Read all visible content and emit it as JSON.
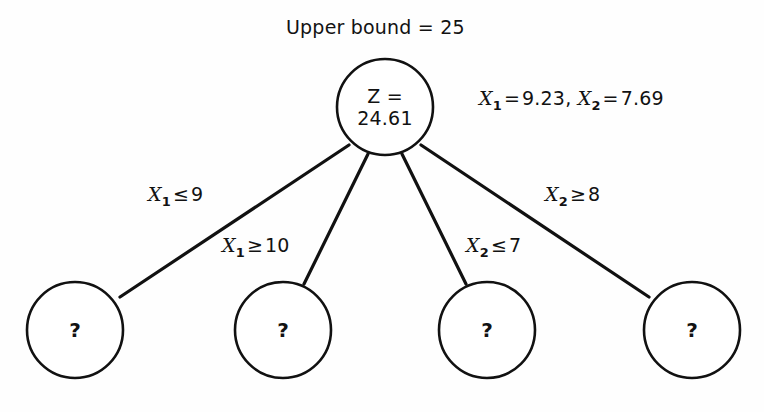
{
  "diagram": {
    "title": "Upper bound = 25",
    "root": {
      "line1": "Z =",
      "line2": "24.61"
    },
    "solution": {
      "var1": "X",
      "sub1": "1",
      "eq1": "=",
      "val1": "9.23,",
      "var2": "X",
      "sub2": "2",
      "eq2": "=",
      "val2": "7.69"
    },
    "branches": [
      {
        "var": "X",
        "sub": "1",
        "op": "≤",
        "value": "9"
      },
      {
        "var": "X",
        "sub": "1",
        "op": "≥",
        "value": "10"
      },
      {
        "var": "X",
        "sub": "2",
        "op": "≤",
        "value": "7"
      },
      {
        "var": "X",
        "sub": "2",
        "op": "≥",
        "value": "8"
      }
    ],
    "leaves": [
      {
        "label": "?"
      },
      {
        "label": "?"
      },
      {
        "label": "?"
      },
      {
        "label": "?"
      }
    ],
    "colors": {
      "stroke": "#111111",
      "text": "#121212",
      "background": "#fefefe",
      "node_fill": "#ffffff"
    }
  }
}
